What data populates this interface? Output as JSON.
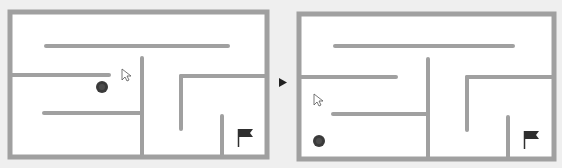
{
  "colors": {
    "background": "#efefef",
    "maze_fill": "#ffffff",
    "wall": "#a0a0a0",
    "ball": "#3a3a3a",
    "ball_highlight": "#5a5a5a",
    "flag": "#2f2f2f",
    "arrow": "#222222",
    "cursor_fill": "#ffffff",
    "cursor_stroke": "#555555"
  },
  "transition_arrow": {
    "icon": "play-triangle-icon",
    "x": 279,
    "y": 78,
    "w": 8,
    "h": 9
  },
  "panels": [
    {
      "name": "maze-before",
      "frame": {
        "x": 10,
        "y": 12,
        "w": 257,
        "h": 145
      },
      "walls": [
        {
          "x1": 46,
          "y1": 46,
          "x2": 228,
          "y2": 46
        },
        {
          "x1": 10,
          "y1": 75,
          "x2": 109,
          "y2": 75
        },
        {
          "x1": 142,
          "y1": 58,
          "x2": 142,
          "y2": 157
        },
        {
          "x1": 44,
          "y1": 113,
          "x2": 142,
          "y2": 113
        },
        {
          "x1": 181,
          "y1": 76,
          "x2": 181,
          "y2": 129
        },
        {
          "x1": 181,
          "y1": 76,
          "x2": 267,
          "y2": 76
        },
        {
          "x1": 222,
          "y1": 116,
          "x2": 222,
          "y2": 157
        }
      ],
      "ball": {
        "cx": 102,
        "cy": 87,
        "r": 6
      },
      "flag": {
        "x": 238,
        "y": 129
      },
      "cursor": {
        "x": 122,
        "y": 69
      }
    },
    {
      "name": "maze-after",
      "frame": {
        "x": 299,
        "y": 14,
        "w": 255,
        "h": 145
      },
      "walls": [
        {
          "x1": 335,
          "y1": 46,
          "x2": 513,
          "y2": 46
        },
        {
          "x1": 299,
          "y1": 77,
          "x2": 396,
          "y2": 77
        },
        {
          "x1": 428,
          "y1": 59,
          "x2": 428,
          "y2": 159
        },
        {
          "x1": 333,
          "y1": 114,
          "x2": 428,
          "y2": 114
        },
        {
          "x1": 467,
          "y1": 77,
          "x2": 467,
          "y2": 130
        },
        {
          "x1": 467,
          "y1": 77,
          "x2": 554,
          "y2": 77
        },
        {
          "x1": 508,
          "y1": 117,
          "x2": 508,
          "y2": 159
        }
      ],
      "ball": {
        "cx": 319,
        "cy": 141,
        "r": 6
      },
      "flag": {
        "x": 524,
        "y": 131
      },
      "cursor": {
        "x": 314,
        "y": 94
      }
    }
  ]
}
